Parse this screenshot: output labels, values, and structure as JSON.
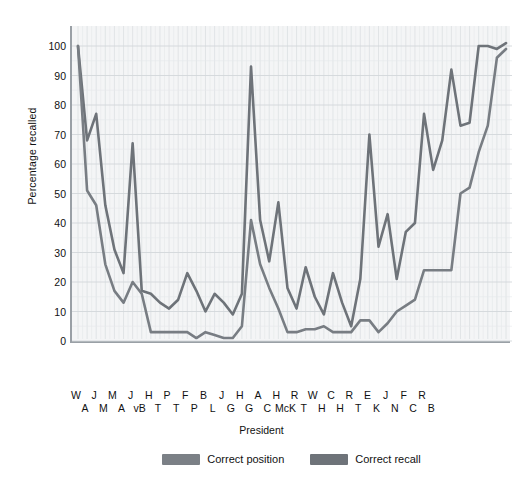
{
  "chart_data": {
    "type": "line",
    "title": "",
    "xlabel": "President",
    "ylabel": "Percentage recalled",
    "ylim": [
      0,
      100
    ],
    "yticks": [
      0,
      10,
      20,
      30,
      40,
      50,
      60,
      70,
      80,
      90,
      100
    ],
    "grid": true,
    "legend_position": "bottom",
    "categories": [
      "W A",
      "J A",
      "M A",
      "J M",
      "M A",
      "J A",
      "H vB",
      "P T",
      "F T",
      "B P",
      "J L",
      "H G",
      "A G",
      "H C",
      "R McK",
      "W T",
      "C H",
      "R H",
      "E T",
      "J K",
      "F N",
      "R C",
      "B B",
      "W",
      "J",
      "M",
      "J",
      "H",
      "P",
      "F",
      "B",
      "J",
      "H",
      "A",
      "H",
      "R",
      "W",
      "C",
      "R",
      "E"
    ],
    "x_labels_row_top": [
      "W",
      "J",
      "M",
      "J",
      "H",
      "P",
      "F",
      "B",
      "J",
      "H",
      "A",
      "H",
      "R",
      "W",
      "C",
      "R",
      "E",
      "J",
      "F",
      "R"
    ],
    "x_labels_row_bottom": [
      "A",
      "M",
      "A",
      "vB",
      "T",
      "T",
      "P",
      "L",
      "G",
      "G",
      "C",
      "McK",
      "T",
      "H",
      "H",
      "T",
      "K",
      "N",
      "C",
      "B"
    ],
    "x_labels_interleaved": [
      "W",
      "A",
      "J",
      "M",
      "M",
      "A",
      "J",
      "vB",
      "H",
      "T",
      "P",
      "T",
      "F",
      "P",
      "B",
      "L",
      "J",
      "G",
      "H",
      "G",
      "A",
      "C",
      "H",
      "McK",
      "R",
      "T",
      "W",
      "H",
      "C",
      "H",
      "R",
      "T",
      "E",
      "K",
      "J",
      "N",
      "F",
      "C",
      "R",
      "B"
    ],
    "series": [
      {
        "name": "Correct recall",
        "color": "#6e7379",
        "values": [
          100,
          68,
          77,
          46,
          31,
          23,
          67,
          17,
          16,
          13,
          11,
          14,
          23,
          17,
          10,
          16,
          13,
          9,
          16,
          93,
          41,
          27,
          47,
          18,
          11,
          25,
          15,
          9,
          23,
          13,
          5,
          21,
          70,
          32,
          43,
          21,
          37,
          40,
          77,
          58
        ]
      },
      {
        "name": "Correct position",
        "color": "#787d83",
        "values": [
          100,
          51,
          46,
          26,
          17,
          13,
          20,
          16,
          3,
          3,
          3,
          3,
          3,
          1,
          3,
          2,
          1,
          1,
          5,
          41,
          26,
          18,
          11,
          3,
          3,
          4,
          4,
          5,
          3,
          3,
          3,
          7,
          7,
          3,
          6,
          10,
          12,
          14,
          24,
          24
        ]
      }
    ],
    "series_tail_recall": [
      68,
      92,
      73,
      74,
      100,
      100,
      99,
      101
    ],
    "series_tail_position": [
      24,
      24,
      50,
      52,
      64,
      73,
      96,
      99
    ],
    "note": "U-shaped serial-position curve of US presidents with a spike at Lincoln"
  },
  "axes": {
    "y_title": "Percentage recalled",
    "x_title": "President"
  },
  "legend": {
    "items": [
      {
        "label": "Correct position",
        "color": "#7b8086"
      },
      {
        "label": "Correct recall",
        "color": "#6e7379"
      }
    ]
  }
}
